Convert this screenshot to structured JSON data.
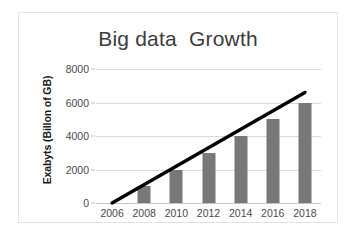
{
  "chart_data": {
    "type": "bar",
    "title": "Big data  Growth",
    "xlabel": "",
    "ylabel": "Exabyts (Billon of GB)",
    "categories": [
      "2006",
      "2008",
      "2010",
      "2012",
      "2014",
      "2016",
      "2018"
    ],
    "values": [
      0,
      1000,
      2000,
      3000,
      4000,
      5000,
      6000
    ],
    "ylim": [
      0,
      8000
    ],
    "yticks": [
      0,
      2000,
      4000,
      6000,
      8000
    ],
    "ytick_labels": [
      "0",
      "2000",
      "4000",
      "6000",
      "8000"
    ],
    "grid": true,
    "legend": "none",
    "series": [
      {
        "name": "Exabyts",
        "type": "bar",
        "values": [
          0,
          1000,
          2000,
          3000,
          4000,
          5000,
          6000
        ],
        "color": "#787878"
      },
      {
        "name": "Trend",
        "type": "line",
        "values": [
          0,
          1100,
          2200,
          3300,
          4400,
          5500,
          6600
        ],
        "color": "#000000"
      }
    ]
  },
  "colors": {
    "bar": "#787878",
    "trend_line": "#000000",
    "gridline": "#d9d9d9",
    "axis": "#c4c4c4",
    "title_text": "#3c3c3c",
    "tick_text": "#4a4a4a",
    "axis_title_text": "#1a1a1a",
    "frame_border": "#e3e3e3",
    "background": "#ffffff"
  }
}
